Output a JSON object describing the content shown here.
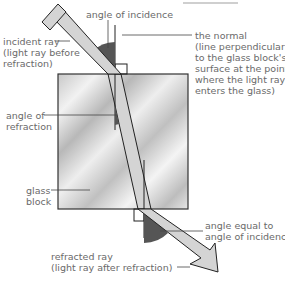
{
  "labels": {
    "angle_of_incidence": "angle of incidence",
    "incident_ray": "incident ray\n(light ray before\nrefraction)",
    "the_normal": "the normal\n(line perpendicular\nto the glass block's\nsurface at the point\nwhere the light ray\nenters the glass)",
    "angle_of_refraction": "angle of\nrefraction",
    "glass_block": "glass\nblock",
    "angle_equal": "angle equal to\nangle of incidence",
    "refracted_ray": "refracted ray\n(light ray after refraction)"
  },
  "colors": {
    "ray_fill": "#d4d4d4",
    "angle_fill": "#555555",
    "label_text": "#6a6a6a",
    "outline": "#222222"
  }
}
